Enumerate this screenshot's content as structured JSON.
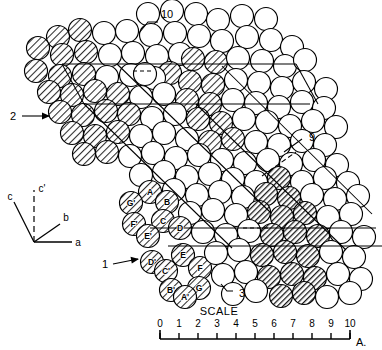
{
  "figure": {
    "background_color": "#ffffff",
    "line_color": "#000000"
  },
  "scale": {
    "title": "SCALE",
    "unit": "A.",
    "ticks": [
      "0",
      "1",
      "2",
      "3",
      "4",
      "5",
      "6",
      "7",
      "8",
      "9",
      "10"
    ],
    "min": 0,
    "max": 10
  },
  "axes": {
    "labels": [
      {
        "name": "c",
        "text": "c"
      },
      {
        "name": "c-prime",
        "text": "c'"
      },
      {
        "name": "b",
        "text": "b"
      },
      {
        "name": "a",
        "text": "a"
      }
    ]
  },
  "callouts": [
    {
      "name": "callout-10",
      "text": "10"
    },
    {
      "name": "callout-2",
      "text": "2"
    },
    {
      "name": "callout-9",
      "text": "9"
    },
    {
      "name": "callout-1",
      "text": "1"
    },
    {
      "name": "callout-3",
      "text": "3"
    }
  ],
  "atom_labels": [
    {
      "text": "A",
      "x": 150,
      "y": 192
    },
    {
      "text": "G'",
      "x": 131,
      "y": 203
    },
    {
      "text": "B",
      "x": 167,
      "y": 202
    },
    {
      "text": "F'",
      "x": 134,
      "y": 224
    },
    {
      "text": "C",
      "x": 163,
      "y": 221
    },
    {
      "text": "E'",
      "x": 148,
      "y": 236
    },
    {
      "text": "D",
      "x": 180,
      "y": 228
    },
    {
      "text": "D'",
      "x": 152,
      "y": 262
    },
    {
      "text": "E",
      "x": 183,
      "y": 255
    },
    {
      "text": "C'",
      "x": 166,
      "y": 271
    },
    {
      "text": "F",
      "x": 200,
      "y": 268
    },
    {
      "text": "B'",
      "x": 171,
      "y": 290
    },
    {
      "text": "G",
      "x": 199,
      "y": 288
    },
    {
      "text": "A'",
      "x": 185,
      "y": 297
    }
  ],
  "atoms": {
    "types": {
      "open": "#ffffff",
      "hatch_light": "#c9c9c9",
      "hatch_dark": "#8f8f8f"
    },
    "radius": 11.5
  },
  "circles": [
    {
      "x": 148,
      "y": 14,
      "t": "open"
    },
    {
      "x": 172,
      "y": 11,
      "t": "open"
    },
    {
      "x": 196,
      "y": 14,
      "t": "open"
    },
    {
      "x": 218,
      "y": 20,
      "t": "open"
    },
    {
      "x": 242,
      "y": 16,
      "t": "open"
    },
    {
      "x": 266,
      "y": 19,
      "t": "open"
    },
    {
      "x": 58,
      "y": 37,
      "t": "hatch_light"
    },
    {
      "x": 80,
      "y": 30,
      "t": "hatch_light"
    },
    {
      "x": 104,
      "y": 33,
      "t": "open"
    },
    {
      "x": 127,
      "y": 31,
      "t": "open"
    },
    {
      "x": 151,
      "y": 35,
      "t": "open"
    },
    {
      "x": 175,
      "y": 33,
      "t": "open"
    },
    {
      "x": 199,
      "y": 36,
      "t": "open"
    },
    {
      "x": 222,
      "y": 41,
      "t": "open"
    },
    {
      "x": 247,
      "y": 37,
      "t": "open"
    },
    {
      "x": 271,
      "y": 40,
      "t": "open"
    },
    {
      "x": 292,
      "y": 47,
      "t": "open"
    },
    {
      "x": 38,
      "y": 48,
      "t": "hatch_light"
    },
    {
      "x": 62,
      "y": 55,
      "t": "hatch_light"
    },
    {
      "x": 86,
      "y": 52,
      "t": "hatch_light"
    },
    {
      "x": 110,
      "y": 55,
      "t": "open"
    },
    {
      "x": 133,
      "y": 53,
      "t": "open"
    },
    {
      "x": 157,
      "y": 56,
      "t": "open"
    },
    {
      "x": 180,
      "y": 54,
      "t": "open"
    },
    {
      "x": 170,
      "y": 73,
      "t": "hatch_light"
    },
    {
      "x": 193,
      "y": 59,
      "t": "hatch_light"
    },
    {
      "x": 216,
      "y": 62,
      "t": "hatch_light"
    },
    {
      "x": 238,
      "y": 58,
      "t": "open"
    },
    {
      "x": 262,
      "y": 61,
      "t": "open"
    },
    {
      "x": 285,
      "y": 66,
      "t": "open"
    },
    {
      "x": 305,
      "y": 60,
      "t": "open"
    },
    {
      "x": 36,
      "y": 71,
      "t": "hatch_light"
    },
    {
      "x": 60,
      "y": 76,
      "t": "hatch_light"
    },
    {
      "x": 84,
      "y": 74,
      "t": "hatch_light"
    },
    {
      "x": 107,
      "y": 77,
      "t": "open"
    },
    {
      "x": 131,
      "y": 75,
      "t": "open"
    },
    {
      "x": 154,
      "y": 78,
      "t": "open"
    },
    {
      "x": 145,
      "y": 74,
      "t": "open"
    },
    {
      "x": 190,
      "y": 82,
      "t": "hatch_light"
    },
    {
      "x": 213,
      "y": 85,
      "t": "hatch_light"
    },
    {
      "x": 236,
      "y": 80,
      "t": "open"
    },
    {
      "x": 259,
      "y": 83,
      "t": "open"
    },
    {
      "x": 282,
      "y": 88,
      "t": "open"
    },
    {
      "x": 304,
      "y": 82,
      "t": "open"
    },
    {
      "x": 326,
      "y": 89,
      "t": "open"
    },
    {
      "x": 49,
      "y": 92,
      "t": "hatch_light"
    },
    {
      "x": 72,
      "y": 95,
      "t": "hatch_light"
    },
    {
      "x": 95,
      "y": 91,
      "t": "hatch_light"
    },
    {
      "x": 118,
      "y": 94,
      "t": "hatch_light"
    },
    {
      "x": 141,
      "y": 97,
      "t": "open"
    },
    {
      "x": 164,
      "y": 94,
      "t": "open"
    },
    {
      "x": 187,
      "y": 100,
      "t": "hatch_light"
    },
    {
      "x": 210,
      "y": 104,
      "t": "hatch_light"
    },
    {
      "x": 233,
      "y": 100,
      "t": "open"
    },
    {
      "x": 256,
      "y": 103,
      "t": "open"
    },
    {
      "x": 279,
      "y": 107,
      "t": "open"
    },
    {
      "x": 302,
      "y": 102,
      "t": "open"
    },
    {
      "x": 324,
      "y": 108,
      "t": "open"
    },
    {
      "x": 60,
      "y": 112,
      "t": "hatch_light"
    },
    {
      "x": 83,
      "y": 115,
      "t": "hatch_light"
    },
    {
      "x": 106,
      "y": 111,
      "t": "hatch_light"
    },
    {
      "x": 129,
      "y": 114,
      "t": "hatch_light"
    },
    {
      "x": 152,
      "y": 118,
      "t": "open"
    },
    {
      "x": 175,
      "y": 114,
      "t": "open"
    },
    {
      "x": 198,
      "y": 119,
      "t": "hatch_light"
    },
    {
      "x": 221,
      "y": 123,
      "t": "hatch_light"
    },
    {
      "x": 244,
      "y": 119,
      "t": "open"
    },
    {
      "x": 267,
      "y": 122,
      "t": "open"
    },
    {
      "x": 290,
      "y": 126,
      "t": "open"
    },
    {
      "x": 313,
      "y": 121,
      "t": "open"
    },
    {
      "x": 336,
      "y": 127,
      "t": "open"
    },
    {
      "x": 72,
      "y": 133,
      "t": "hatch_light"
    },
    {
      "x": 95,
      "y": 136,
      "t": "hatch_light"
    },
    {
      "x": 118,
      "y": 132,
      "t": "hatch_light"
    },
    {
      "x": 141,
      "y": 136,
      "t": "open"
    },
    {
      "x": 164,
      "y": 133,
      "t": "open"
    },
    {
      "x": 187,
      "y": 139,
      "t": "open"
    },
    {
      "x": 210,
      "y": 142,
      "t": "hatch_light"
    },
    {
      "x": 233,
      "y": 139,
      "t": "hatch_light"
    },
    {
      "x": 256,
      "y": 142,
      "t": "open"
    },
    {
      "x": 279,
      "y": 145,
      "t": "open"
    },
    {
      "x": 302,
      "y": 141,
      "t": "open"
    },
    {
      "x": 325,
      "y": 145,
      "t": "open"
    },
    {
      "x": 84,
      "y": 154,
      "t": "hatch_light"
    },
    {
      "x": 107,
      "y": 152,
      "t": "hatch_light"
    },
    {
      "x": 130,
      "y": 156,
      "t": "open"
    },
    {
      "x": 153,
      "y": 153,
      "t": "open"
    },
    {
      "x": 176,
      "y": 158,
      "t": "open"
    },
    {
      "x": 199,
      "y": 155,
      "t": "open"
    },
    {
      "x": 222,
      "y": 160,
      "t": "open"
    },
    {
      "x": 245,
      "y": 163,
      "t": "open"
    },
    {
      "x": 268,
      "y": 160,
      "t": "open"
    },
    {
      "x": 291,
      "y": 164,
      "t": "open"
    },
    {
      "x": 314,
      "y": 160,
      "t": "open"
    },
    {
      "x": 337,
      "y": 165,
      "t": "open"
    },
    {
      "x": 141,
      "y": 175,
      "t": "open"
    },
    {
      "x": 164,
      "y": 172,
      "t": "open"
    },
    {
      "x": 187,
      "y": 177,
      "t": "open"
    },
    {
      "x": 210,
      "y": 174,
      "t": "open"
    },
    {
      "x": 233,
      "y": 179,
      "t": "open"
    },
    {
      "x": 256,
      "y": 182,
      "t": "open"
    },
    {
      "x": 279,
      "y": 178,
      "t": "hatch_dark"
    },
    {
      "x": 302,
      "y": 182,
      "t": "open"
    },
    {
      "x": 325,
      "y": 178,
      "t": "open"
    },
    {
      "x": 348,
      "y": 183,
      "t": "open"
    },
    {
      "x": 150,
      "y": 192,
      "t": "hatch_light"
    },
    {
      "x": 174,
      "y": 190,
      "t": "open"
    },
    {
      "x": 197,
      "y": 195,
      "t": "open"
    },
    {
      "x": 220,
      "y": 192,
      "t": "open"
    },
    {
      "x": 243,
      "y": 197,
      "t": "open"
    },
    {
      "x": 266,
      "y": 194,
      "t": "hatch_dark"
    },
    {
      "x": 289,
      "y": 198,
      "t": "hatch_dark"
    },
    {
      "x": 312,
      "y": 195,
      "t": "open"
    },
    {
      "x": 335,
      "y": 199,
      "t": "open"
    },
    {
      "x": 358,
      "y": 196,
      "t": "open"
    },
    {
      "x": 131,
      "y": 203,
      "t": "hatch_light"
    },
    {
      "x": 167,
      "y": 202,
      "t": "hatch_light"
    },
    {
      "x": 190,
      "y": 213,
      "t": "open"
    },
    {
      "x": 213,
      "y": 210,
      "t": "open"
    },
    {
      "x": 236,
      "y": 215,
      "t": "open"
    },
    {
      "x": 259,
      "y": 212,
      "t": "hatch_dark"
    },
    {
      "x": 282,
      "y": 217,
      "t": "hatch_dark"
    },
    {
      "x": 305,
      "y": 213,
      "t": "hatch_dark"
    },
    {
      "x": 328,
      "y": 217,
      "t": "open"
    },
    {
      "x": 351,
      "y": 214,
      "t": "open"
    },
    {
      "x": 134,
      "y": 224,
      "t": "hatch_light"
    },
    {
      "x": 163,
      "y": 221,
      "t": "hatch_light"
    },
    {
      "x": 180,
      "y": 228,
      "t": "hatch_light"
    },
    {
      "x": 148,
      "y": 236,
      "t": "hatch_light"
    },
    {
      "x": 203,
      "y": 232,
      "t": "open"
    },
    {
      "x": 226,
      "y": 235,
      "t": "open"
    },
    {
      "x": 249,
      "y": 231,
      "t": "open"
    },
    {
      "x": 272,
      "y": 235,
      "t": "hatch_dark"
    },
    {
      "x": 295,
      "y": 232,
      "t": "hatch_dark"
    },
    {
      "x": 318,
      "y": 236,
      "t": "hatch_dark"
    },
    {
      "x": 341,
      "y": 232,
      "t": "open"
    },
    {
      "x": 364,
      "y": 237,
      "t": "open"
    },
    {
      "x": 152,
      "y": 262,
      "t": "hatch_light"
    },
    {
      "x": 183,
      "y": 255,
      "t": "hatch_light"
    },
    {
      "x": 166,
      "y": 271,
      "t": "hatch_light"
    },
    {
      "x": 200,
      "y": 268,
      "t": "hatch_light"
    },
    {
      "x": 216,
      "y": 253,
      "t": "open"
    },
    {
      "x": 239,
      "y": 250,
      "t": "open"
    },
    {
      "x": 262,
      "y": 255,
      "t": "hatch_dark"
    },
    {
      "x": 285,
      "y": 252,
      "t": "hatch_dark"
    },
    {
      "x": 308,
      "y": 256,
      "t": "hatch_dark"
    },
    {
      "x": 331,
      "y": 252,
      "t": "open"
    },
    {
      "x": 354,
      "y": 257,
      "t": "open"
    },
    {
      "x": 171,
      "y": 290,
      "t": "hatch_light"
    },
    {
      "x": 199,
      "y": 288,
      "t": "hatch_light"
    },
    {
      "x": 185,
      "y": 297,
      "t": "hatch_light"
    },
    {
      "x": 223,
      "y": 275,
      "t": "open"
    },
    {
      "x": 246,
      "y": 272,
      "t": "open"
    },
    {
      "x": 269,
      "y": 277,
      "t": "hatch_dark"
    },
    {
      "x": 292,
      "y": 274,
      "t": "hatch_dark"
    },
    {
      "x": 315,
      "y": 278,
      "t": "hatch_dark"
    },
    {
      "x": 338,
      "y": 274,
      "t": "open"
    },
    {
      "x": 361,
      "y": 279,
      "t": "open"
    },
    {
      "x": 233,
      "y": 294,
      "t": "open"
    },
    {
      "x": 256,
      "y": 291,
      "t": "open"
    },
    {
      "x": 281,
      "y": 296,
      "t": "hatch_dark"
    },
    {
      "x": 304,
      "y": 293,
      "t": "hatch_dark"
    },
    {
      "x": 327,
      "y": 297,
      "t": "open"
    },
    {
      "x": 350,
      "y": 293,
      "t": "open"
    }
  ]
}
